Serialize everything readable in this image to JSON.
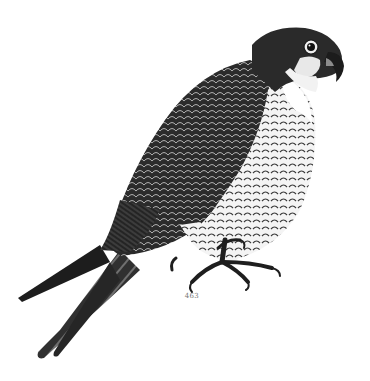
{
  "image": {
    "subject": "Engraved illustration of a perched falcon (peregrine), facing right",
    "style": "black-and-white wood engraving",
    "background_color": "#ffffff",
    "ink_color": "#1a1a1a"
  },
  "caption": {
    "text": "463"
  }
}
